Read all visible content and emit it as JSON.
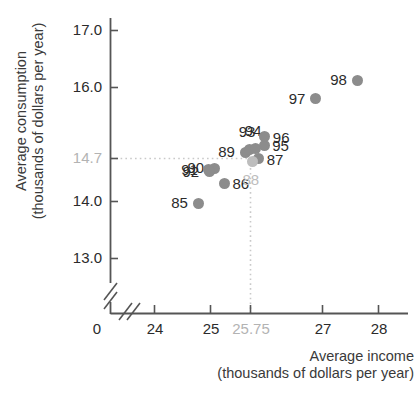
{
  "chart_data": {
    "type": "scatter",
    "title": "",
    "xlabel": "Average income (thousands of dollars per year)",
    "ylabel": "Average consumption (thousands of dollars per year)",
    "xlabel_line1": "Average income",
    "xlabel_line2": "(thousands of dollars per year)",
    "ylabel_line1": "Average consumption",
    "ylabel_line2": "(thousands of dollars per year)",
    "xlim": [
      23.6,
      28.4
    ],
    "ylim": [
      12.6,
      17.3
    ],
    "grid": false,
    "legend": null,
    "axis_break_x": true,
    "axis_break_y": true,
    "origin_label": "0",
    "xticks": [
      {
        "value": 24,
        "label": "24",
        "highlight": false
      },
      {
        "value": 25,
        "label": "25",
        "highlight": false
      },
      {
        "value": 25.75,
        "label": "25.75",
        "highlight": true
      },
      {
        "value": 27,
        "label": "27",
        "highlight": false
      },
      {
        "value": 28,
        "label": "28",
        "highlight": false
      }
    ],
    "yticks": [
      {
        "value": 17.0,
        "label": "17.0",
        "highlight": false
      },
      {
        "value": 16.0,
        "label": "16.0",
        "highlight": false
      },
      {
        "value": 14.7,
        "label": "14.7",
        "highlight": true
      },
      {
        "value": 14.0,
        "label": "14.0",
        "highlight": false
      },
      {
        "value": 13.0,
        "label": "13.0",
        "highlight": false
      }
    ],
    "reference_lines": {
      "x": 25.75,
      "y": 14.7,
      "style": "dotted",
      "color": "#c9c9c9"
    },
    "points": [
      {
        "label": "85",
        "x": 24.78,
        "y": 13.97,
        "label_pos": "left",
        "highlight": false
      },
      {
        "label": "86",
        "x": 25.25,
        "y": 14.32,
        "label_pos": "right",
        "highlight": false
      },
      {
        "label": "87",
        "x": 25.86,
        "y": 14.75,
        "label_pos": "right",
        "highlight": false
      },
      {
        "label": "88",
        "x": 25.75,
        "y": 14.7,
        "label_pos": "below",
        "highlight": true
      },
      {
        "label": "89",
        "x": 25.62,
        "y": 14.86,
        "label_pos": "left",
        "highlight": false
      },
      {
        "label": "90",
        "x": 25.07,
        "y": 14.58,
        "label_pos": "left",
        "highlight": false
      },
      {
        "label": "91",
        "x": 24.96,
        "y": 14.56,
        "label_pos": "left",
        "highlight": false
      },
      {
        "label": "92",
        "x": 24.98,
        "y": 14.52,
        "label_pos": "left",
        "highlight": false
      },
      {
        "label": "93",
        "x": 25.7,
        "y": 14.92,
        "label_pos": "above",
        "highlight": false
      },
      {
        "label": "94",
        "x": 25.81,
        "y": 14.93,
        "label_pos": "above",
        "highlight": false
      },
      {
        "label": "95",
        "x": 25.96,
        "y": 14.99,
        "label_pos": "right",
        "highlight": false
      },
      {
        "label": "96",
        "x": 25.97,
        "y": 15.14,
        "label_pos": "right",
        "highlight": false
      },
      {
        "label": "97",
        "x": 26.88,
        "y": 15.8,
        "label_pos": "left",
        "highlight": false
      },
      {
        "label": "98",
        "x": 27.62,
        "y": 16.13,
        "label_pos": "left",
        "highlight": false
      }
    ],
    "colors": {
      "dot": "#8c8c8c",
      "axis": "#555555",
      "text": "#2b2b2b",
      "highlight": "#bdbdbd",
      "reference": "#c9c9c9",
      "background": "#ffffff"
    }
  }
}
